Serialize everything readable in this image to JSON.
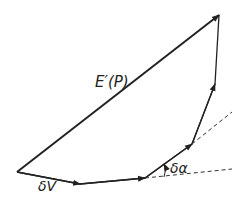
{
  "diagram": {
    "labels": {
      "resultant": "E′(P)",
      "first_step": "δV",
      "angle": "δα"
    },
    "points": [
      [
        17,
        172
      ],
      [
        80,
        184
      ],
      [
        145,
        178
      ],
      [
        192,
        144
      ],
      [
        215,
        84
      ],
      [
        219,
        15
      ]
    ],
    "colors": {
      "line": "#222222",
      "background": "#ffffff"
    }
  }
}
